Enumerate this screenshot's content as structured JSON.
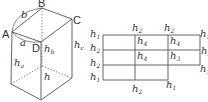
{
  "box": {
    "vertices": {
      "A": "A",
      "B": "B",
      "C": "C",
      "D": "D"
    },
    "edges": {
      "a": "a",
      "b": "b"
    },
    "heights": {
      "h_a": {
        "base": "h",
        "sub": "a"
      },
      "h_b": {
        "base": "h",
        "sub": "b"
      },
      "h_c": {
        "base": "h",
        "sub": "c"
      },
      "h": {
        "base": "h",
        "sub": ""
      }
    }
  },
  "net": {
    "left_labels": [
      {
        "base": "h",
        "sub": "1"
      },
      {
        "base": "h",
        "sub": "2"
      },
      {
        "base": "h",
        "sub": "2"
      },
      {
        "base": "h",
        "sub": "1"
      }
    ],
    "top_labels": [
      {
        "base": "h",
        "sub": "2"
      },
      {
        "base": "h",
        "sub": "2"
      }
    ],
    "right_labels": [
      {
        "base": "h",
        "sub": "1"
      },
      {
        "base": "h",
        "sub": "2"
      },
      {
        "base": "h",
        "sub": "1"
      }
    ],
    "bottom_labels": [
      {
        "base": "h",
        "sub": "2"
      },
      {
        "base": "h",
        "sub": "1"
      }
    ],
    "cells": [
      {
        "base": "h",
        "sub": "4"
      },
      {
        "base": "h",
        "sub": "4"
      },
      {
        "base": "h",
        "sub": "4"
      },
      {
        "base": "h",
        "sub": "3"
      }
    ]
  },
  "colors": {
    "line": "#555555",
    "text": "#333333"
  }
}
